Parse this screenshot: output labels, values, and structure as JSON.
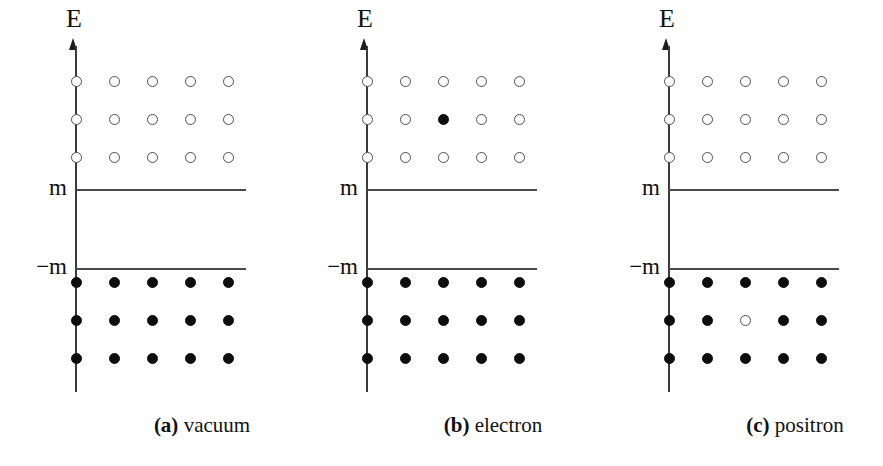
{
  "figure": {
    "type": "dirac-sea-energy-level-diagram",
    "panel_count": 3,
    "axis": {
      "y_label": "E",
      "upper_threshold_label": "m",
      "lower_threshold_label": "−m"
    },
    "lattice": {
      "columns": 5,
      "rows_upper": 3,
      "rows_lower": 3,
      "column_x": [
        75,
        113,
        151,
        189,
        227
      ],
      "row_y": [
        0,
        38,
        76
      ]
    },
    "colors": {
      "background": "#ffffff",
      "axis": "#3a3a3a",
      "level_line": "#4a4a4a",
      "empty_state_stroke": "#4d4d4d",
      "filled_state": "#0d0d0d",
      "text": "#111111"
    }
  },
  "panels": [
    {
      "id": "panel-a",
      "tag": "(a)",
      "name": "vacuum",
      "left": 55,
      "upper_states": [
        [
          "empty",
          "empty",
          "empty",
          "empty",
          "empty"
        ],
        [
          "empty",
          "empty",
          "empty",
          "empty",
          "empty"
        ],
        [
          "empty",
          "empty",
          "empty",
          "empty",
          "empty"
        ]
      ],
      "lower_states": [
        [
          "filled",
          "filled",
          "filled",
          "filled",
          "filled"
        ],
        [
          "filled",
          "filled",
          "filled",
          "filled",
          "filled"
        ],
        [
          "filled",
          "filled",
          "filled",
          "filled",
          "filled"
        ]
      ]
    },
    {
      "id": "panel-b",
      "tag": "(b)",
      "name": "electron",
      "left": 346,
      "upper_states": [
        [
          "empty",
          "empty",
          "empty",
          "empty",
          "empty"
        ],
        [
          "empty",
          "empty",
          "filled",
          "empty",
          "empty"
        ],
        [
          "empty",
          "empty",
          "empty",
          "empty",
          "empty"
        ]
      ],
      "lower_states": [
        [
          "filled",
          "filled",
          "filled",
          "filled",
          "filled"
        ],
        [
          "filled",
          "filled",
          "filled",
          "filled",
          "filled"
        ],
        [
          "filled",
          "filled",
          "filled",
          "filled",
          "filled"
        ]
      ]
    },
    {
      "id": "panel-c",
      "tag": "(c)",
      "name": "positron",
      "left": 648,
      "upper_states": [
        [
          "empty",
          "empty",
          "empty",
          "empty",
          "empty"
        ],
        [
          "empty",
          "empty",
          "empty",
          "empty",
          "empty"
        ],
        [
          "empty",
          "empty",
          "empty",
          "empty",
          "empty"
        ]
      ],
      "lower_states": [
        [
          "filled",
          "filled",
          "filled",
          "filled",
          "filled"
        ],
        [
          "filled",
          "filled",
          "empty",
          "filled",
          "filled"
        ],
        [
          "filled",
          "filled",
          "filled",
          "filled",
          "filled"
        ]
      ]
    }
  ],
  "chart_data": {
    "type": "scatter",
    "title": "",
    "xlabel": "",
    "ylabel": "E",
    "grid": false,
    "legend": null,
    "annotations": [
      "m",
      "−m"
    ],
    "series": [
      {
        "name": "(a) vacuum",
        "upper_occupancy": [
          [
            0,
            0,
            0,
            0,
            0
          ],
          [
            0,
            0,
            0,
            0,
            0
          ],
          [
            0,
            0,
            0,
            0,
            0
          ]
        ],
        "lower_occupancy": [
          [
            1,
            1,
            1,
            1,
            1
          ],
          [
            1,
            1,
            1,
            1,
            1
          ],
          [
            1,
            1,
            1,
            1,
            1
          ]
        ]
      },
      {
        "name": "(b) electron",
        "upper_occupancy": [
          [
            0,
            0,
            0,
            0,
            0
          ],
          [
            0,
            0,
            1,
            0,
            0
          ],
          [
            0,
            0,
            0,
            0,
            0
          ]
        ],
        "lower_occupancy": [
          [
            1,
            1,
            1,
            1,
            1
          ],
          [
            1,
            1,
            1,
            1,
            1
          ],
          [
            1,
            1,
            1,
            1,
            1
          ]
        ]
      },
      {
        "name": "(c) positron",
        "upper_occupancy": [
          [
            0,
            0,
            0,
            0,
            0
          ],
          [
            0,
            0,
            0,
            0,
            0
          ],
          [
            0,
            0,
            0,
            0,
            0
          ]
        ],
        "lower_occupancy": [
          [
            1,
            1,
            1,
            1,
            1
          ],
          [
            1,
            1,
            0,
            1,
            1
          ],
          [
            1,
            1,
            1,
            1,
            1
          ]
        ]
      }
    ]
  }
}
